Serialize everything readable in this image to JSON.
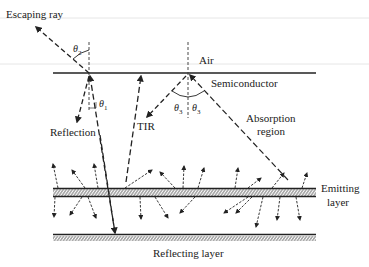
{
  "labels": {
    "escaping_ray": "Escaping ray",
    "air": "Air",
    "semiconductor": "Semiconductor",
    "reflection": "Reflection",
    "tir": "TIR",
    "absorption_region_line1": "Absorption",
    "absorption_region_line2": "region",
    "emitting_layer_line1": "Emitting",
    "emitting_layer_line2": "layer",
    "reflecting_layer": "Reflecting layer"
  },
  "angles": {
    "theta1": "θ",
    "theta1_sub": "1",
    "theta2": "θ",
    "theta2_sub": "2",
    "theta3_left": "θ",
    "theta3_left_sub": "3",
    "theta3_right": "θ",
    "theta3_right_sub": "3"
  },
  "colors": {
    "ink": "#222222",
    "faint_line": "#e6e6e6",
    "background": "#ffffff"
  }
}
